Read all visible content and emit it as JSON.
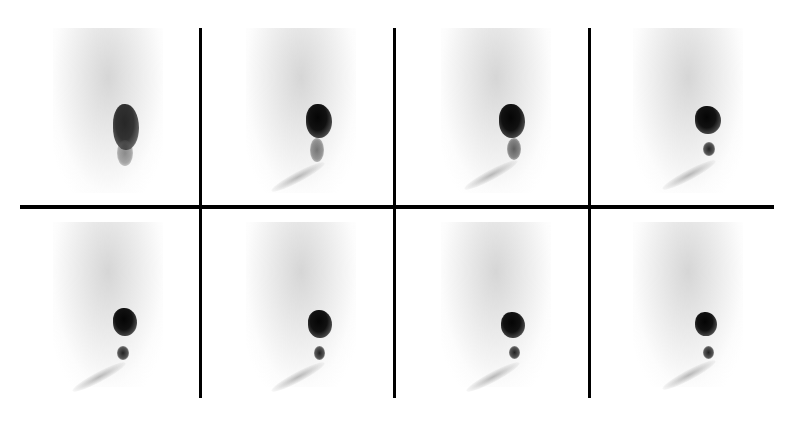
{
  "figure": {
    "layout": {
      "rows": 2,
      "columns": 4
    },
    "frames": [
      {
        "index": 1,
        "row": 1,
        "col": 1,
        "hot_spot": "single elongated",
        "distal_activity": "faint"
      },
      {
        "index": 2,
        "row": 1,
        "col": 2,
        "hot_spot": "single elongated",
        "distal_activity": "faint"
      },
      {
        "index": 3,
        "row": 1,
        "col": 3,
        "hot_spot": "single elongated",
        "distal_activity": "moderate"
      },
      {
        "index": 4,
        "row": 1,
        "col": 4,
        "hot_spot": "dense",
        "distal_activity": "small focus"
      },
      {
        "index": 5,
        "row": 2,
        "col": 1,
        "hot_spot": "dense",
        "distal_activity": "small focus"
      },
      {
        "index": 6,
        "row": 2,
        "col": 2,
        "hot_spot": "dense",
        "distal_activity": "small focus"
      },
      {
        "index": 7,
        "row": 2,
        "col": 3,
        "hot_spot": "dense",
        "distal_activity": "small focus"
      },
      {
        "index": 8,
        "row": 2,
        "col": 4,
        "hot_spot": "dense",
        "distal_activity": "small focus"
      }
    ],
    "colors": {
      "background": "#ffffff",
      "grid_lines": "#000000",
      "activity": "#050505"
    }
  }
}
